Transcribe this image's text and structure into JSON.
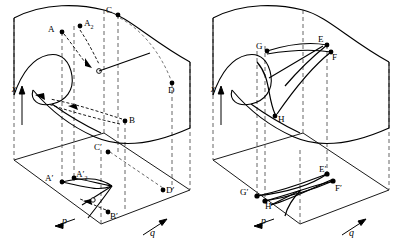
{
  "figure": {
    "type": "3d-fold-surface-diagram",
    "panel_count": 2,
    "line_color": "#000000",
    "dashed_color": "#555555",
    "background": "#ffffff"
  },
  "panels": [
    {
      "id": "left",
      "axes": {
        "vertical": {
          "label": "x",
          "arrow": "up"
        },
        "left_horizontal": {
          "label": "p",
          "arrow": "left-down"
        },
        "right_horizontal": {
          "label": "q",
          "arrow": "right-up"
        }
      },
      "surface_points": [
        {
          "name": "A",
          "label": "A",
          "x": 62,
          "y": 32,
          "lx": 50,
          "ly": 27
        },
        {
          "name": "A2",
          "label": "A",
          "sub": "2",
          "x": 80,
          "y": 26,
          "lx": 84,
          "ly": 22
        },
        {
          "name": "C",
          "label": "C",
          "x": 118,
          "y": 15,
          "lx": 107,
          "ly": 10
        },
        {
          "name": "D",
          "label": "D",
          "x": 172,
          "y": 83,
          "lx": 168,
          "ly": 88
        },
        {
          "name": "B",
          "label": "B",
          "x": 125,
          "y": 121,
          "lx": 128,
          "ly": 116
        }
      ],
      "base_points": [
        {
          "name": "Ap",
          "label": "A′",
          "x": 62,
          "y": 182,
          "lx": 47,
          "ly": 176
        },
        {
          "name": "A2p",
          "label": "A′",
          "sub": "2",
          "x": 74,
          "y": 178,
          "lx": 77,
          "ly": 172
        },
        {
          "name": "Cp",
          "label": "C′",
          "x": 108,
          "y": 152,
          "lx": 96,
          "ly": 147
        },
        {
          "name": "Dp",
          "label": "D′",
          "x": 163,
          "y": 190,
          "lx": 166,
          "ly": 188
        },
        {
          "name": "Bp",
          "label": "B′",
          "x": 108,
          "y": 212,
          "lx": 111,
          "ly": 212
        }
      ]
    },
    {
      "id": "right",
      "axes": {
        "vertical": {
          "label": "x",
          "arrow": "up"
        },
        "left_horizontal": {
          "label": "p",
          "arrow": "left-down"
        },
        "right_horizontal": {
          "label": "q",
          "arrow": "right-up"
        }
      },
      "surface_points": [
        {
          "name": "G",
          "label": "G",
          "x": 66,
          "y": 51,
          "lx": 55,
          "ly": 45
        },
        {
          "name": "E",
          "label": "E",
          "x": 126,
          "y": 45,
          "lx": 118,
          "ly": 39
        },
        {
          "name": "F",
          "label": "F",
          "x": 130,
          "y": 52,
          "lx": 131,
          "ly": 56
        },
        {
          "name": "H",
          "label": "H",
          "x": 74,
          "y": 116,
          "lx": 77,
          "ly": 118
        }
      ],
      "base_points": [
        {
          "name": "Gp",
          "label": "G′",
          "x": 56,
          "y": 196,
          "lx": 41,
          "ly": 190
        },
        {
          "name": "Hp",
          "label": "H′",
          "x": 64,
          "y": 201,
          "lx": 65,
          "ly": 204
        },
        {
          "name": "Ep",
          "label": "E′",
          "x": 126,
          "y": 174,
          "lx": 119,
          "ly": 169
        },
        {
          "name": "Fp",
          "label": "F′",
          "x": 132,
          "y": 181,
          "lx": 134,
          "ly": 186
        }
      ]
    }
  ],
  "caption": {
    "axis_x": "x",
    "axis_p": "p",
    "axis_q": "q"
  }
}
